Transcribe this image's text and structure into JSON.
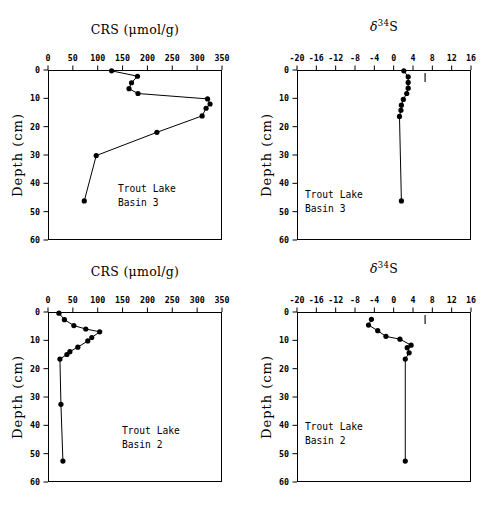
{
  "figure": {
    "width": 498,
    "height": 515,
    "background": "#ffffff",
    "line_color": "#000000",
    "marker_color": "#000000"
  },
  "axis_labels": {
    "depth": "Depth (cm)",
    "crs_title": "CRS (μmol/g)",
    "d34s_title_delta": "δ",
    "d34s_title_sup": "34",
    "d34s_title_tail": "S"
  },
  "chart_data": [
    {
      "id": "crs-basin3",
      "type": "line",
      "title": "CRS (μmol/g)",
      "xlabel": "CRS (μmol/g)",
      "ylabel": "Depth (cm)",
      "annotation": [
        "Trout Lake",
        "Basin 3"
      ],
      "xlim": [
        0,
        350
      ],
      "ylim": [
        0,
        60
      ],
      "y_inverted": true,
      "xticks": [
        0,
        50,
        100,
        150,
        200,
        250,
        300,
        350
      ],
      "yticks": [
        0,
        10,
        20,
        30,
        40,
        50,
        60
      ],
      "grid": false,
      "legend": null,
      "x": [
        128,
        180,
        168,
        163,
        181,
        321,
        326,
        318,
        310,
        219,
        97,
        73
      ],
      "y": [
        0.3,
        2.2,
        4.5,
        6.6,
        8.3,
        10.2,
        12.0,
        13.5,
        16.2,
        22.0,
        30.2,
        46.2
      ],
      "series": [
        {
          "name": "CRS",
          "points": [
            {
              "crs": 128,
              "depth": 0.3
            },
            {
              "crs": 180,
              "depth": 2.2
            },
            {
              "crs": 168,
              "depth": 4.5
            },
            {
              "crs": 163,
              "depth": 6.6
            },
            {
              "crs": 181,
              "depth": 8.3
            },
            {
              "crs": 321,
              "depth": 10.2
            },
            {
              "crs": 326,
              "depth": 12.0
            },
            {
              "crs": 318,
              "depth": 13.5
            },
            {
              "crs": 310,
              "depth": 16.2
            },
            {
              "crs": 219,
              "depth": 22.0
            },
            {
              "crs": 97,
              "depth": 30.2
            },
            {
              "crs": 73,
              "depth": 46.2
            }
          ]
        }
      ]
    },
    {
      "id": "d34s-basin3",
      "type": "line",
      "title": "δ³⁴S",
      "xlabel": "δ³⁴S",
      "ylabel": "Depth (cm)",
      "annotation": [
        "Trout Lake",
        "Basin 3"
      ],
      "xlim": [
        -20,
        16
      ],
      "ylim": [
        0,
        60
      ],
      "y_inverted": true,
      "xticks": [
        -20,
        -16,
        -12,
        -8,
        -4,
        0,
        4,
        8,
        12,
        16
      ],
      "yticks": [
        0,
        10,
        20,
        30,
        40,
        50,
        60
      ],
      "grid": false,
      "legend": null,
      "reference_tick": {
        "value": 6.5,
        "depth": 1.4,
        "label": ""
      },
      "x": [
        2.1,
        3.0,
        3.0,
        3.0,
        2.7,
        2.0,
        1.6,
        1.5,
        1.2,
        1.6
      ],
      "y": [
        0.3,
        2.4,
        4.4,
        6.4,
        8.3,
        10.4,
        12.4,
        14.2,
        16.4,
        46.2
      ],
      "series": [
        {
          "name": "δ³⁴S",
          "points": [
            {
              "d34s": 2.1,
              "depth": 0.3
            },
            {
              "d34s": 3.0,
              "depth": 2.4
            },
            {
              "d34s": 3.0,
              "depth": 4.4
            },
            {
              "d34s": 3.0,
              "depth": 6.4
            },
            {
              "d34s": 2.7,
              "depth": 8.3
            },
            {
              "d34s": 2.0,
              "depth": 10.4
            },
            {
              "d34s": 1.6,
              "depth": 12.4
            },
            {
              "d34s": 1.5,
              "depth": 14.2
            },
            {
              "d34s": 1.2,
              "depth": 16.4
            },
            {
              "d34s": 1.6,
              "depth": 46.2
            }
          ]
        }
      ]
    },
    {
      "id": "crs-basin2",
      "type": "line",
      "title": "CRS (μmol/g)",
      "xlabel": "CRS (μmol/g)",
      "ylabel": "Depth (cm)",
      "annotation": [
        "Trout Lake",
        "Basin 2"
      ],
      "xlim": [
        0,
        350
      ],
      "ylim": [
        0,
        60
      ],
      "y_inverted": true,
      "xticks": [
        0,
        50,
        100,
        150,
        200,
        250,
        300,
        350
      ],
      "yticks": [
        0,
        10,
        20,
        30,
        40,
        50,
        60
      ],
      "grid": false,
      "legend": null,
      "x": [
        22,
        33,
        52,
        76,
        104,
        88,
        80,
        60,
        44,
        38,
        24,
        26,
        30
      ],
      "y": [
        0.4,
        2.7,
        4.8,
        6.0,
        7.0,
        9.0,
        10.2,
        12.4,
        14.0,
        15.0,
        16.6,
        32.6,
        52.6
      ],
      "series": [
        {
          "name": "CRS",
          "points": [
            {
              "crs": 22,
              "depth": 0.4
            },
            {
              "crs": 33,
              "depth": 2.7
            },
            {
              "crs": 52,
              "depth": 4.8
            },
            {
              "crs": 76,
              "depth": 6.0
            },
            {
              "crs": 104,
              "depth": 7.0
            },
            {
              "crs": 88,
              "depth": 9.0
            },
            {
              "crs": 80,
              "depth": 10.2
            },
            {
              "crs": 60,
              "depth": 12.4
            },
            {
              "crs": 44,
              "depth": 14.0
            },
            {
              "crs": 38,
              "depth": 15.0
            },
            {
              "crs": 24,
              "depth": 16.6
            },
            {
              "crs": 26,
              "depth": 32.6
            },
            {
              "crs": 30,
              "depth": 52.6
            }
          ]
        }
      ]
    },
    {
      "id": "d34s-basin2",
      "type": "line",
      "title": "δ³⁴S",
      "xlabel": "δ³⁴S",
      "ylabel": "Depth (cm)",
      "annotation": [
        "Trout Lake",
        "Basin 2"
      ],
      "xlim": [
        -20,
        16
      ],
      "ylim": [
        0,
        60
      ],
      "y_inverted": true,
      "xticks": [
        -20,
        -16,
        -12,
        -8,
        -4,
        0,
        4,
        8,
        12,
        16
      ],
      "yticks": [
        0,
        10,
        20,
        30,
        40,
        50,
        60
      ],
      "grid": false,
      "legend": null,
      "reference_tick": {
        "value": 6.5,
        "depth": 1.4,
        "label": ""
      },
      "x": [
        -4.6,
        -5.2,
        -3.3,
        -1.6,
        1.3,
        3.6,
        2.8,
        3.2,
        2.4,
        2.4
      ],
      "y": [
        2.6,
        4.6,
        6.6,
        8.6,
        9.6,
        11.7,
        12.6,
        14.4,
        16.6,
        52.6
      ],
      "series": [
        {
          "name": "δ³⁴S",
          "points": [
            {
              "d34s": -4.6,
              "depth": 2.6
            },
            {
              "d34s": -5.2,
              "depth": 4.6
            },
            {
              "d34s": -3.3,
              "depth": 6.6
            },
            {
              "d34s": -1.6,
              "depth": 8.6
            },
            {
              "d34s": 1.3,
              "depth": 9.6
            },
            {
              "d34s": 3.6,
              "depth": 11.7
            },
            {
              "d34s": 2.8,
              "depth": 12.6
            },
            {
              "d34s": 3.2,
              "depth": 14.4
            },
            {
              "d34s": 2.4,
              "depth": 16.6
            },
            {
              "d34s": 2.4,
              "depth": 52.6
            }
          ]
        }
      ]
    }
  ]
}
